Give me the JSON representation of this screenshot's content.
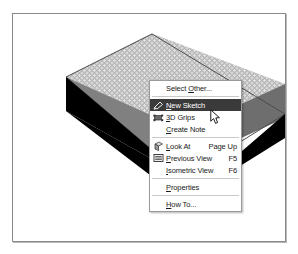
{
  "app": {
    "view_label": "3D model viewport"
  },
  "viewport": {
    "shape_name": "extruded rectangular solid",
    "top_face_fill": "#b7b7b7",
    "top_face_dot": "#e2e2e2",
    "front_face_fill": "#808080",
    "right_face_fill": "#6e6e6e",
    "outline_color": "#4d4d4d"
  },
  "context_menu": {
    "highlight_color": "#3a3a3a",
    "background": "#ffffff",
    "border_color": "#9a9a9a",
    "groups": [
      {
        "items": [
          {
            "label": "Select Other...",
            "mnemonic": "O",
            "accel": "",
            "icon": "",
            "selected": false
          }
        ]
      },
      {
        "items": [
          {
            "label": "New Sketch",
            "mnemonic": "N",
            "accel": "",
            "icon": "new-sketch-icon",
            "selected": true
          },
          {
            "label": "3D Grips",
            "mnemonic": "3",
            "accel": "",
            "icon": "3d-grips-icon",
            "selected": false
          },
          {
            "label": "Create Note",
            "mnemonic": "C",
            "accel": "",
            "icon": "",
            "selected": false
          }
        ]
      },
      {
        "items": [
          {
            "label": "Look At",
            "mnemonic": "L",
            "accel": "Page Up",
            "icon": "look-at-icon",
            "selected": false
          },
          {
            "label": "Previous View",
            "mnemonic": "P",
            "accel": "F5",
            "icon": "previous-view-icon",
            "selected": false
          },
          {
            "label": "Isometric View",
            "mnemonic": "I",
            "accel": "F6",
            "icon": "",
            "selected": false
          }
        ]
      },
      {
        "items": [
          {
            "label": "Properties",
            "mnemonic": "P",
            "accel": "",
            "icon": "",
            "selected": false
          }
        ]
      },
      {
        "items": [
          {
            "label": "How To...",
            "mnemonic": "H",
            "accel": "",
            "icon": "",
            "selected": false
          }
        ]
      }
    ]
  },
  "cursor": {
    "name": "arrow-pointer",
    "x": 197,
    "y": 95
  }
}
